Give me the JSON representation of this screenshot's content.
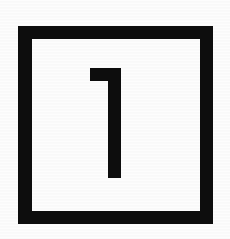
{
  "image": {
    "kind": "scanned-symbol",
    "description": "Thick black square outline containing the numeral 1",
    "width": 230,
    "height": 239,
    "background_color": "#ffffff",
    "ink_color": "#0d0d0d"
  },
  "frame": {
    "shape_name": "square-outline",
    "left": 18,
    "top": 26,
    "width": 195,
    "height": 198,
    "stroke_width": 13,
    "stroke_color": "#0d0d0d",
    "fill_color": "#ffffff"
  },
  "glyph": {
    "character": "1",
    "label": "numeral-one",
    "style": "flat-top flag, vertical stem, no base serif",
    "color": "#0d0d0d",
    "flag_left": 90,
    "flag_top": 68,
    "flag_height": 13,
    "stem_left": 108,
    "stem_right": 121,
    "stem_bottom": 178
  }
}
